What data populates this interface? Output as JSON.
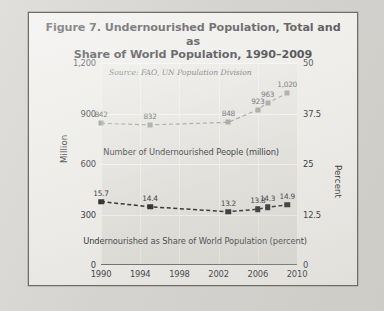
{
  "figure": {
    "title_line1": "Figure 7. Undernourished Population, Total and as",
    "title_line2": "Share of World Population, 1990–2009",
    "source_note": "Source: FAO, UN Population Division"
  },
  "ghost_text": [
    {
      "text": "Table 5. Undernourished Population",
      "x": 36,
      "y": 95,
      "size": 9
    },
    {
      "text": "in the 50 Nations Identified as Highly",
      "x": 34,
      "y": 109,
      "size": 9
    },
    {
      "text": "Vulnerable to Political Instability",
      "x": 38,
      "y": 123,
      "size": 9
    },
    {
      "text": "Table 5. Nominal Economic Vari",
      "x": 120,
      "y": 175,
      "size": 9
    },
    {
      "text": "Share in Global GDP",
      "x": 150,
      "y": 190,
      "size": 9
    },
    {
      "text": "Brazil, Argentina",
      "x": 160,
      "y": 226,
      "size": 9
    },
    {
      "text": "and several other",
      "x": 158,
      "y": 240,
      "size": 9
    }
  ],
  "chart_data": {
    "type": "line",
    "title": "Figure 7. Undernourished Population, Total and as Share of World Population, 1990–2009",
    "xlabel": "",
    "ylabel": "Million",
    "y2label": "Percent",
    "grid": true,
    "legend_position": "inline-below-series",
    "xlim": [
      1990,
      2010
    ],
    "ylim": [
      0,
      1200
    ],
    "y2lim": [
      0,
      50
    ],
    "y_ticks": [
      "0",
      "300",
      "600",
      "900",
      "1,200"
    ],
    "y_tick_values": [
      0,
      300,
      600,
      900,
      1200
    ],
    "y2_ticks": [
      "0",
      "12.5",
      "25",
      "37.5",
      "50"
    ],
    "y2_tick_values": [
      0,
      12.5,
      25,
      37.5,
      50
    ],
    "x_ticks": [
      "1990",
      "1994",
      "1998",
      "2002",
      "2006",
      "2010"
    ],
    "x_tick_values": [
      1990,
      1994,
      1998,
      2002,
      2006,
      2010
    ],
    "series": [
      {
        "name": "Number of Undernourished People (million)",
        "axis": "left",
        "unit": "million",
        "color": "#8a8a88",
        "marker": "square",
        "linestyle": "dashed",
        "x": [
          1990,
          1995,
          2003,
          2006,
          2007,
          2009
        ],
        "values": [
          842,
          832,
          848,
          923,
          963,
          1020
        ],
        "labels": [
          "842",
          "832",
          "848",
          "923",
          "963",
          "1,020"
        ]
      },
      {
        "name": "Undernourished as Share of World Population (percent)",
        "axis": "right",
        "unit": "percent",
        "color": "#131316",
        "marker": "square",
        "linestyle": "dashed",
        "x": [
          1990,
          1995,
          2003,
          2006,
          2007,
          2009
        ],
        "values": [
          15.7,
          14.4,
          13.2,
          13.8,
          14.3,
          14.9
        ],
        "labels": [
          "15.7",
          "14.4",
          "13.2",
          "13.8",
          "14.3",
          "14.9"
        ]
      }
    ],
    "annotations": [
      "Source: FAO, UN Population Division"
    ]
  }
}
